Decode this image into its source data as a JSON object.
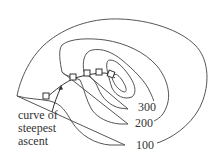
{
  "diagram": {
    "type": "contour-map",
    "contour_labels": {
      "c300": "300",
      "c200": "200",
      "c100": "100"
    },
    "annotation": {
      "line1": "curve of",
      "line2": "steepest",
      "line3": "ascent"
    },
    "colors": {
      "line": "#555555",
      "text": "#333333",
      "background": "#ffffff"
    }
  }
}
